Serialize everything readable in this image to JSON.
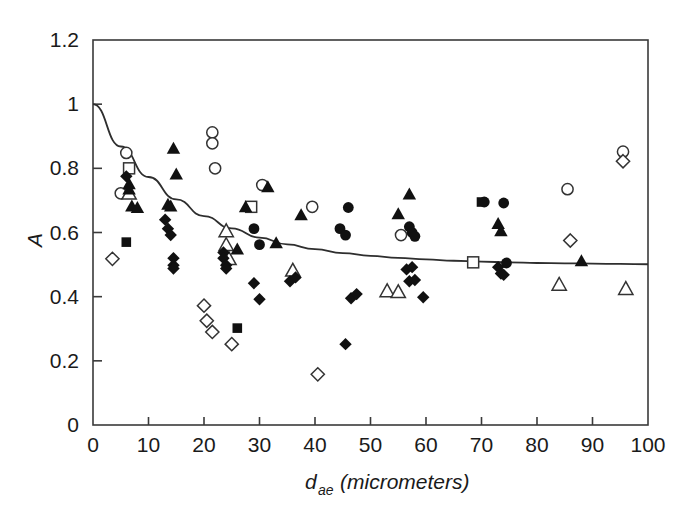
{
  "chart_data": {
    "type": "scatter",
    "title": "",
    "subtitle": "",
    "xlabel_main": "d",
    "xlabel_sub": "ae",
    "xlabel_unit": "(micrometers)",
    "xlabel_full": "d_ae (micrometers)",
    "ylabel": "A",
    "xlim": [
      0,
      100
    ],
    "ylim": [
      0,
      1.2
    ],
    "xticks": [
      0,
      10,
      20,
      30,
      40,
      50,
      60,
      70,
      80,
      90,
      100
    ],
    "xtick_labels": [
      "0",
      "10",
      "20",
      "30",
      "40",
      "50",
      "60",
      "70",
      "80",
      "90",
      "100"
    ],
    "yticks": [
      0,
      0.2,
      0.4,
      0.6,
      0.8,
      1,
      1.2
    ],
    "ytick_labels": [
      "0",
      "0.2",
      "0.4",
      "0.6",
      "0.8",
      "1",
      "1.2"
    ],
    "grid": false,
    "legend": null,
    "legend_position": "none",
    "marker_color_filled": "#111111",
    "marker_color_open": "#ffffff",
    "marker_edge_color": "#333333",
    "curve_color": "#2e2e2e",
    "axis_color": "#3a3a3a",
    "fit_curve": {
      "label": "exponential decay fit",
      "form": "A = 0.5 + 0.5*exp(-x/16.5)",
      "asymptote": 0.5,
      "intercept": 1.0,
      "decay_constant": 16.5,
      "points": [
        [
          0,
          1.0
        ],
        [
          5,
          0.868
        ],
        [
          10,
          0.773
        ],
        [
          15,
          0.703
        ],
        [
          20,
          0.651
        ],
        [
          25,
          0.613
        ],
        [
          30,
          0.584
        ],
        [
          35,
          0.563
        ],
        [
          40,
          0.548
        ],
        [
          45,
          0.536
        ],
        [
          50,
          0.527
        ],
        [
          55,
          0.521
        ],
        [
          60,
          0.516
        ],
        [
          65,
          0.512
        ],
        [
          70,
          0.509
        ],
        [
          75,
          0.507
        ],
        [
          80,
          0.505
        ],
        [
          85,
          0.504
        ],
        [
          90,
          0.503
        ],
        [
          95,
          0.502
        ],
        [
          100,
          0.501
        ]
      ]
    },
    "series": [
      {
        "name": "open-circle",
        "marker": "open-circle",
        "points": [
          [
            6.0,
            0.848
          ],
          [
            5.0,
            0.722
          ],
          [
            21.5,
            0.912
          ],
          [
            21.5,
            0.878
          ],
          [
            22.0,
            0.8
          ],
          [
            30.5,
            0.748
          ],
          [
            39.5,
            0.68
          ],
          [
            55.5,
            0.592
          ],
          [
            85.5,
            0.735
          ],
          [
            95.5,
            0.852
          ]
        ]
      },
      {
        "name": "open-square",
        "marker": "open-square",
        "points": [
          [
            6.5,
            0.8
          ],
          [
            28.5,
            0.68
          ],
          [
            68.5,
            0.507
          ]
        ]
      },
      {
        "name": "open-triangle",
        "marker": "open-triangle",
        "points": [
          [
            6.5,
            0.722
          ],
          [
            24.0,
            0.605
          ],
          [
            24.0,
            0.562
          ],
          [
            24.5,
            0.518
          ],
          [
            36.0,
            0.482
          ],
          [
            53.0,
            0.418
          ],
          [
            55.0,
            0.415
          ],
          [
            84.0,
            0.438
          ],
          [
            96.0,
            0.425
          ]
        ]
      },
      {
        "name": "open-diamond",
        "marker": "open-diamond",
        "points": [
          [
            3.5,
            0.518
          ],
          [
            20.0,
            0.372
          ],
          [
            20.5,
            0.325
          ],
          [
            21.5,
            0.29
          ],
          [
            25.0,
            0.252
          ],
          [
            40.5,
            0.158
          ],
          [
            86.0,
            0.575
          ],
          [
            95.5,
            0.822
          ]
        ]
      },
      {
        "name": "filled-circle",
        "marker": "filled-circle",
        "points": [
          [
            29.0,
            0.612
          ],
          [
            30.0,
            0.562
          ],
          [
            44.5,
            0.612
          ],
          [
            45.5,
            0.592
          ],
          [
            46.0,
            0.678
          ],
          [
            57.0,
            0.618
          ],
          [
            57.5,
            0.6
          ],
          [
            58.0,
            0.588
          ],
          [
            70.5,
            0.695
          ],
          [
            74.0,
            0.692
          ],
          [
            74.5,
            0.505
          ]
        ]
      },
      {
        "name": "filled-square",
        "marker": "filled-square",
        "points": [
          [
            6.0,
            0.57
          ],
          [
            26.0,
            0.302
          ],
          [
            70.0,
            0.695
          ]
        ]
      },
      {
        "name": "filled-triangle",
        "marker": "filled-triangle",
        "points": [
          [
            6.5,
            0.752
          ],
          [
            6.5,
            0.735
          ],
          [
            7.0,
            0.682
          ],
          [
            8.0,
            0.678
          ],
          [
            13.5,
            0.688
          ],
          [
            14.0,
            0.682
          ],
          [
            14.5,
            0.862
          ],
          [
            15.0,
            0.782
          ],
          [
            26.0,
            0.548
          ],
          [
            27.5,
            0.68
          ],
          [
            31.5,
            0.742
          ],
          [
            33.0,
            0.568
          ],
          [
            37.5,
            0.655
          ],
          [
            55.0,
            0.658
          ],
          [
            57.0,
            0.72
          ],
          [
            73.0,
            0.628
          ],
          [
            73.5,
            0.605
          ],
          [
            88.0,
            0.512
          ]
        ]
      },
      {
        "name": "filled-diamond",
        "marker": "filled-diamond",
        "points": [
          [
            6.0,
            0.775
          ],
          [
            13.0,
            0.64
          ],
          [
            13.5,
            0.612
          ],
          [
            14.0,
            0.592
          ],
          [
            14.5,
            0.52
          ],
          [
            14.5,
            0.498
          ],
          [
            14.5,
            0.488
          ],
          [
            23.5,
            0.538
          ],
          [
            23.5,
            0.52
          ],
          [
            24.0,
            0.498
          ],
          [
            24.0,
            0.488
          ],
          [
            29.0,
            0.442
          ],
          [
            30.0,
            0.392
          ],
          [
            35.5,
            0.448
          ],
          [
            36.5,
            0.46
          ],
          [
            45.5,
            0.252
          ],
          [
            46.5,
            0.395
          ],
          [
            47.5,
            0.408
          ],
          [
            56.5,
            0.485
          ],
          [
            57.5,
            0.492
          ],
          [
            57.0,
            0.448
          ],
          [
            58.0,
            0.452
          ],
          [
            59.5,
            0.398
          ],
          [
            73.0,
            0.492
          ],
          [
            73.5,
            0.472
          ],
          [
            74.0,
            0.468
          ]
        ]
      }
    ]
  },
  "figure": {
    "background": "#ffffff"
  }
}
